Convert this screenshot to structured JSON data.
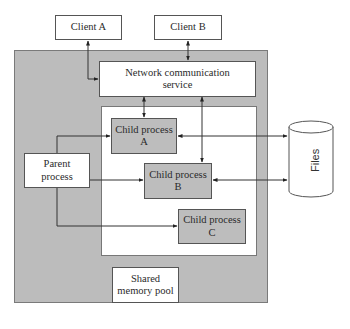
{
  "diagram": {
    "clients": [
      {
        "label": "Client A"
      },
      {
        "label": "Client B"
      }
    ],
    "network_service": {
      "line1": "Network communication",
      "line2": "service"
    },
    "parent_process": {
      "line1": "Parent",
      "line2": "process"
    },
    "child_processes": [
      {
        "line1": "Child process",
        "line2": "A"
      },
      {
        "line1": "Child process",
        "line2": "B"
      },
      {
        "line1": "Child process",
        "line2": "C"
      }
    ],
    "shared_memory": {
      "line1": "Shared",
      "line2": "memory pool"
    },
    "files": {
      "label": "Files"
    },
    "colors": {
      "container_fill": "#bcbcbc",
      "child_fill": "#bdbdbd",
      "box_fill": "#ffffff",
      "line": "#333333"
    }
  }
}
